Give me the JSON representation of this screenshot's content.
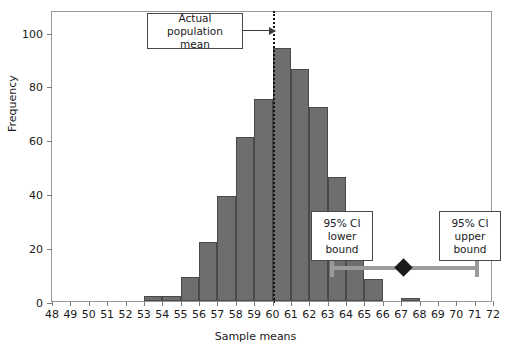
{
  "chart_data": {
    "type": "bar",
    "title": "",
    "subtitle": "",
    "xlabel": "Sample means",
    "ylabel": "Frequency",
    "xlim": [
      48,
      72
    ],
    "ylim": [
      0,
      108
    ],
    "grid": false,
    "legend_position": "none",
    "bin_width": 1,
    "x_tick_labels": [
      "48",
      "49",
      "50",
      "51",
      "52",
      "53",
      "54",
      "55",
      "56",
      "57",
      "58",
      "59",
      "60",
      "61",
      "62",
      "63",
      "64",
      "65",
      "66",
      "67",
      "68",
      "69",
      "70",
      "71",
      "72"
    ],
    "y_tick_labels": [
      "0",
      "20",
      "40",
      "60",
      "80",
      "100"
    ],
    "y_ticks": [
      0,
      20,
      40,
      60,
      80,
      100
    ],
    "categories": [
      "48-49",
      "49-50",
      "50-51",
      "51-52",
      "52-53",
      "53-54",
      "54-55",
      "55-56",
      "56-57",
      "57-58",
      "58-59",
      "59-60",
      "60-61",
      "61-62",
      "62-63",
      "63-64",
      "64-65",
      "65-66",
      "66-67",
      "67-68",
      "68-69",
      "69-70",
      "70-71",
      "71-72"
    ],
    "bin_starts": [
      48,
      49,
      50,
      51,
      52,
      53,
      54,
      55,
      56,
      57,
      58,
      59,
      60,
      61,
      62,
      63,
      64,
      65,
      66,
      67,
      68,
      69,
      70,
      71
    ],
    "values": [
      0,
      0,
      0,
      0,
      0,
      2,
      2,
      9,
      22,
      39,
      61,
      75,
      94,
      86,
      72,
      46,
      18,
      8,
      0,
      1,
      0,
      0,
      0,
      0
    ],
    "annotations": [
      {
        "name": "actual-population-mean",
        "label": "Actual\npopulation mean",
        "line1": "Actual",
        "line2": "population mean",
        "target_x": 60,
        "style": "dotted-vertical-line-with-arrow"
      },
      {
        "name": "ci-lower-bound",
        "line1": "95% CI",
        "line2": "lower",
        "line3": "bound",
        "target_x": 63.3
      },
      {
        "name": "ci-upper-bound",
        "line1": "95% CI",
        "line2": "upper",
        "line3": "bound",
        "target_x": 71.2
      }
    ],
    "confidence_interval": {
      "lower": 63.3,
      "upper": 71.2,
      "point_estimate": 67.2,
      "level": "95%",
      "y_position": 17
    },
    "colors": {
      "bar_fill": "#6e6e6e",
      "bar_edge": "#4a4a4a",
      "mean_line": "#111111",
      "ci_bar": "#9b9b9b",
      "ci_marker": "#1a1a1a",
      "frame": "#9a9a9a",
      "background": "#ffffff",
      "text": "#1a1a1a"
    }
  }
}
